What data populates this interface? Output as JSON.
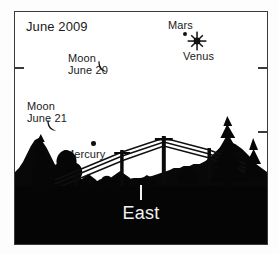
{
  "chart": {
    "type": "sky-map",
    "title": "June 2009",
    "direction_label": "East",
    "background_color": "#ffffff",
    "silhouette_color": "#080808",
    "frame_color": "#3a3a3a",
    "objects": [
      {
        "name": "Mars",
        "label": "Mars",
        "symbol": "dot",
        "x_pct": 66.9,
        "y_pct": 9.4
      },
      {
        "name": "Venus",
        "label": "Venus",
        "symbol": "starburst",
        "x_pct": 71.7,
        "y_pct": 12.4
      },
      {
        "name": "Moon June 20",
        "label": "Moon\nJune 20",
        "symbol": "crescent",
        "x_pct": 34.3,
        "y_pct": 23.1
      },
      {
        "name": "Moon June 21",
        "label": "Moon\nJune 21",
        "symbol": "crescent",
        "x_pct": 14.4,
        "y_pct": 48.3
      },
      {
        "name": "Mercury",
        "label": "Mercury",
        "symbol": "dot",
        "x_pct": 31.1,
        "y_pct": 56.0
      }
    ],
    "labels": {
      "title": "June 2009",
      "mars": "Mars",
      "venus": "Venus",
      "moon_june_20_line1": "Moon",
      "moon_june_20_line2": "June 20",
      "moon_june_21_line1": "Moon",
      "moon_june_21_line2": "June 21",
      "mercury": "Mercury",
      "east": "East"
    },
    "horizon": {
      "description": "black silhouette of trees, houses and power-line towers",
      "features": [
        "tree-left",
        "houses",
        "power-line-pylons",
        "tree-right"
      ]
    }
  }
}
